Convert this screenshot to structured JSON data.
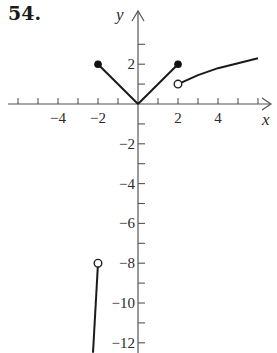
{
  "problem": {
    "number": "54."
  },
  "chart_data": {
    "type": "line",
    "title": "",
    "xlabel": "x",
    "ylabel": "y",
    "xlim": [
      -6.5,
      6.6
    ],
    "ylim": [
      -12.5,
      4.6
    ],
    "grid": false,
    "x_ticks": [
      -6,
      -5,
      -4,
      -3,
      -2,
      -1,
      1,
      2,
      3,
      4,
      5,
      6
    ],
    "x_tick_labels": [
      "−4",
      "−2",
      "2",
      "4"
    ],
    "x_tick_label_values": [
      -4,
      -2,
      2,
      4
    ],
    "y_ticks": [
      3,
      2,
      1,
      -1,
      -2,
      -3,
      -4,
      -5,
      -6,
      -7,
      -8,
      -9,
      -10,
      -11,
      -12
    ],
    "y_tick_labels": [
      "2",
      "−2",
      "−4",
      "−6",
      "−8",
      "−10",
      "−12"
    ],
    "y_tick_label_values": [
      2,
      -2,
      -4,
      -6,
      -8,
      -10,
      -12
    ],
    "series": [
      {
        "name": "left branch of |x|",
        "points": [
          [
            -2,
            2
          ],
          [
            0,
            0
          ]
        ],
        "start": "closed",
        "end": "none"
      },
      {
        "name": "right branch of |x|",
        "points": [
          [
            0,
            0
          ],
          [
            2,
            2
          ]
        ],
        "start": "none",
        "end": "closed"
      },
      {
        "name": "right curve",
        "points": [
          [
            2,
            1
          ],
          [
            3,
            1.45
          ],
          [
            4,
            1.8
          ],
          [
            5,
            2.05
          ],
          [
            6,
            2.3
          ]
        ],
        "start": "open",
        "end": "none"
      },
      {
        "name": "lower left line",
        "points": [
          [
            -2,
            -8
          ],
          [
            -2.25,
            -12.5
          ]
        ],
        "start": "open",
        "end": "none"
      }
    ],
    "points": [
      {
        "x": -2,
        "y": 2,
        "type": "closed"
      },
      {
        "x": 2,
        "y": 2,
        "type": "closed"
      },
      {
        "x": 2,
        "y": 1,
        "type": "open"
      },
      {
        "x": -2,
        "y": -8,
        "type": "open"
      }
    ]
  }
}
